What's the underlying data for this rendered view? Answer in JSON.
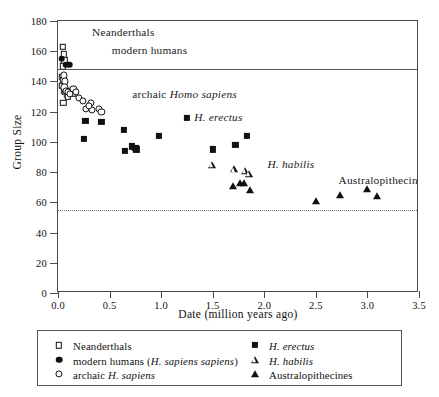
{
  "chart_data": {
    "type": "scatter",
    "title": "",
    "xlabel": "Date (million years ago)",
    "ylabel": "Group Size",
    "xlim": [
      0.0,
      3.5
    ],
    "ylim": [
      0,
      180
    ],
    "xticks": [
      "0.0",
      "0.5",
      "1.0",
      "1.5",
      "2.0",
      "2.5",
      "3.0",
      "3.5"
    ],
    "yticks": [
      "0",
      "20",
      "40",
      "60",
      "80",
      "100",
      "120",
      "140",
      "160",
      "180"
    ],
    "grid": false,
    "legend_position": "below-plot",
    "reference_lines": [
      {
        "name": "upper-solid-line",
        "y": 148,
        "style": "solid"
      },
      {
        "name": "lower-dotted-line",
        "y": 55,
        "style": "dotted"
      }
    ],
    "annotations": [
      {
        "name": "neanderthals-label",
        "text": "Neanderthals",
        "x": 0.33,
        "y": 172
      },
      {
        "name": "modern-humans-label",
        "text": "modern humans",
        "x": 0.52,
        "y": 160
      },
      {
        "name": "archaic-homo-sapiens-label",
        "text": "archaic Homo sapiens",
        "x": 0.72,
        "y": 131,
        "italic_from": 8
      },
      {
        "name": "h-erectus-label",
        "text": "H. erectus",
        "x": 1.32,
        "y": 116,
        "italic": true
      },
      {
        "name": "h-habilis-label",
        "text": "H. habilis",
        "x": 2.03,
        "y": 85,
        "italic": true
      },
      {
        "name": "australopithecines-label",
        "text": "Australopithecines",
        "x": 2.72,
        "y": 74
      }
    ],
    "series": [
      {
        "name": "Neanderthals",
        "marker": "open-square",
        "points": [
          [
            0.048,
            163
          ],
          [
            0.055,
            158
          ],
          [
            0.062,
            154
          ],
          [
            0.047,
            150
          ],
          [
            0.04,
            143
          ],
          [
            0.052,
            141
          ],
          [
            0.043,
            137
          ],
          [
            0.06,
            134
          ],
          [
            0.072,
            133
          ],
          [
            0.085,
            131
          ],
          [
            0.05,
            126
          ],
          [
            0.098,
            130
          ],
          [
            0.13,
            134
          ],
          [
            0.145,
            132
          ]
        ]
      },
      {
        "name": "modern humans (H. sapiens sapiens)",
        "marker": "filled-circle",
        "points": [
          [
            0.035,
            155
          ],
          [
            0.075,
            151
          ],
          [
            0.11,
            151
          ]
        ]
      },
      {
        "name": "archaic H. sapiens",
        "marker": "open-circle",
        "points": [
          [
            0.055,
            144
          ],
          [
            0.068,
            140
          ],
          [
            0.062,
            136
          ],
          [
            0.078,
            134
          ],
          [
            0.095,
            133
          ],
          [
            0.115,
            132
          ],
          [
            0.15,
            135
          ],
          [
            0.175,
            133
          ],
          [
            0.205,
            129
          ],
          [
            0.245,
            127
          ],
          [
            0.27,
            122
          ],
          [
            0.32,
            126
          ],
          [
            0.33,
            121
          ],
          [
            0.395,
            122
          ],
          [
            0.42,
            120
          ],
          [
            0.3,
            124
          ]
        ]
      },
      {
        "name": "H. erectus",
        "marker": "filled-square",
        "points": [
          [
            0.265,
            114
          ],
          [
            0.255,
            102
          ],
          [
            0.42,
            113
          ],
          [
            0.64,
            108
          ],
          [
            0.65,
            94
          ],
          [
            0.72,
            97
          ],
          [
            0.76,
            95
          ],
          [
            0.75,
            96
          ],
          [
            0.98,
            104
          ],
          [
            1.25,
            116
          ],
          [
            1.5,
            95
          ],
          [
            1.72,
            98
          ],
          [
            1.83,
            104
          ]
        ]
      },
      {
        "name": "H. habilis",
        "marker": "open-triangle",
        "points": [
          [
            1.49,
            85
          ],
          [
            1.71,
            82
          ],
          [
            1.81,
            81
          ],
          [
            1.85,
            79
          ]
        ]
      },
      {
        "name": "Australopithecines",
        "marker": "filled-triangle",
        "points": [
          [
            1.7,
            71
          ],
          [
            1.76,
            73
          ],
          [
            1.8,
            73
          ],
          [
            1.86,
            68
          ],
          [
            2.5,
            61
          ],
          [
            2.73,
            65
          ],
          [
            3.0,
            69
          ],
          [
            3.09,
            64
          ]
        ]
      }
    ]
  },
  "legend": {
    "left_column": [
      {
        "marker": "open-square",
        "label": "Neanderthals"
      },
      {
        "marker": "filled-circle",
        "label": "modern humans (H. sapiens sapiens)",
        "italic_part": "H. sapiens sapiens"
      },
      {
        "marker": "open-circle",
        "label": "archaic H. sapiens",
        "italic_part": "H. sapiens"
      }
    ],
    "right_column": [
      {
        "marker": "filled-square",
        "label": "H. erectus",
        "italic": true
      },
      {
        "marker": "open-triangle",
        "label": "H. habilis",
        "italic": true
      },
      {
        "marker": "filled-triangle",
        "label": "Australopithecines"
      }
    ]
  },
  "colors": {
    "marker": "#111111",
    "axis": "#4a4a4a",
    "reference_line": "#555555",
    "dotted_line": "#777777",
    "background": "#ffffff"
  }
}
